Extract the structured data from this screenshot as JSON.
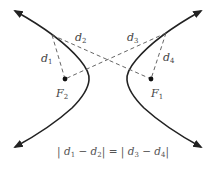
{
  "diagram": {
    "type": "hyperbola-foci-distances",
    "colors": {
      "curve": "#222222",
      "dashed": "#555555",
      "text": "#444444"
    },
    "foci": [
      {
        "id": "F2",
        "label": "F",
        "sub": "2",
        "x": 65,
        "y": 79
      },
      {
        "id": "F1",
        "label": "F",
        "sub": "1",
        "x": 151,
        "y": 79
      }
    ],
    "distances": [
      {
        "label": "d",
        "sub": "1"
      },
      {
        "label": "d",
        "sub": "2"
      },
      {
        "label": "d",
        "sub": "3"
      },
      {
        "label": "d",
        "sub": "4"
      }
    ],
    "equation": {
      "parts": [
        "| ",
        "d",
        "1",
        " − ",
        "d",
        "2",
        "| = | ",
        "d",
        "3",
        " − ",
        "d",
        "4",
        "|"
      ]
    }
  }
}
